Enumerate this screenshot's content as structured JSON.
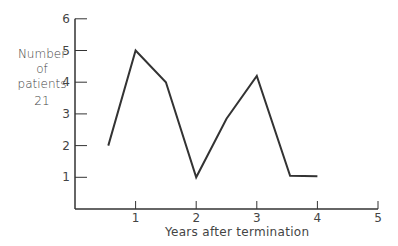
{
  "chart_data": {
    "type": "line",
    "title": "",
    "xlabel": "Years after termination",
    "ylabel": [
      "Number",
      "of",
      "patients",
      "21"
    ],
    "x": [
      0.55,
      1.0,
      1.5,
      2.0,
      2.5,
      3.0,
      3.55,
      4.0
    ],
    "series": [
      {
        "name": "Number of patients",
        "values": [
          2,
          5,
          4,
          1,
          2.85,
          4.2,
          1.05,
          1.03
        ]
      }
    ],
    "xticks": [
      1,
      2,
      3,
      4,
      5
    ],
    "yticks": [
      1,
      2,
      3,
      4,
      5,
      6
    ],
    "xlim": [
      0,
      5
    ],
    "ylim": [
      0,
      6
    ],
    "grid": false,
    "legend": "none"
  },
  "axes": {
    "xlabel": "Years after termination",
    "ylabel_lines": [
      "Number",
      "of",
      "patients",
      "21"
    ]
  }
}
